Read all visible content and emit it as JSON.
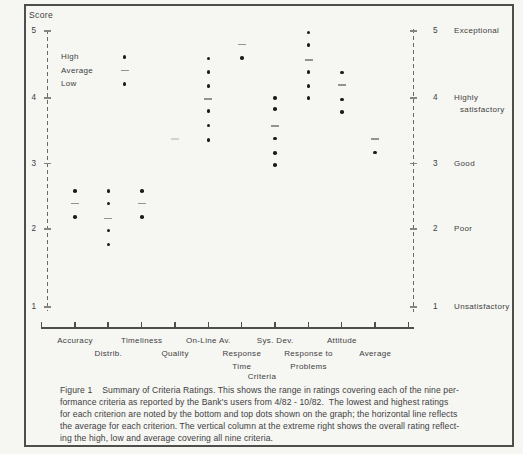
{
  "chart": {
    "score_axis_title": "Score",
    "criteria_axis_title": "Criteria"
  },
  "caption": {
    "lines": [
      "Figure 1    Summary of Criteria Ratings. This shows the range in ratings covering each of the nine per-",
      "formance criteria as reported by the Bank's users from 4/82 - 10/82.  The lowest and highest ratings",
      "for each criterion are noted by the bottom and top dots shown on the graph; the horizontal line reflects",
      "the average for each criterion. The vertical column at the extreme right shows the overall rating reflect-",
      "ing the high, low and average covering all nine criteria."
    ]
  },
  "colors": {
    "paper": "#f6f6f3",
    "ink": "#3e3e3e",
    "dot": "#1c1c1c",
    "dash": "#94948c"
  },
  "chart_data": {
    "type": "scatter",
    "title": "Figure 1  Summary of Criteria Ratings",
    "xlabel": "Criteria",
    "ylabel": "Score",
    "ylim": [
      1,
      5
    ],
    "grid": false,
    "legend": [
      {
        "label": "High",
        "symbol": "dot"
      },
      {
        "label": "Average",
        "symbol": "dash"
      },
      {
        "label": "Low",
        "symbol": "dot"
      }
    ],
    "score_ratings": [
      {
        "score": 5,
        "rating": "Exceptional",
        "rating_lines": [
          "Exceptional"
        ]
      },
      {
        "score": 4,
        "rating": "Highly satisfactory",
        "rating_lines": [
          "Highly",
          "satisfactory"
        ]
      },
      {
        "score": 3,
        "rating": "Good",
        "rating_lines": [
          "Good"
        ]
      },
      {
        "score": 2,
        "rating": "Poor",
        "rating_lines": [
          "Poor"
        ]
      },
      {
        "score": 1,
        "rating": "Unsatisfactory",
        "rating_lines": [
          "Unsatisfactory"
        ]
      }
    ],
    "categories": [
      "Accuracy",
      "Distrib.",
      "Timeliness",
      "Quality",
      "On-Line Av.",
      "Response Time",
      "Sys. Dev.",
      "Response to Problems",
      "Attitude",
      "Average"
    ],
    "columns": [
      {
        "label": "Accuracy",
        "label_lines": [
          "Accuracy"
        ],
        "label_row": 1,
        "dots": [
          2.58,
          2.18
        ],
        "average_dash": 2.39
      },
      {
        "label": "Distrib.",
        "label_lines": [
          "Distrib."
        ],
        "label_row": 2,
        "dots": [
          2.58,
          2.39,
          1.98,
          1.8
        ],
        "average_dash": 2.16
      },
      {
        "label": "Timeliness",
        "label_lines": [
          "Timeliness"
        ],
        "label_row": 1,
        "dots": [
          2.58,
          2.18
        ],
        "average_dash": 2.39
      },
      {
        "label": "Quality",
        "label_lines": [
          "Quality"
        ],
        "label_row": 2,
        "dots": [],
        "average_dash": 3.37,
        "faint": true
      },
      {
        "label": "On-Line Av.",
        "label_lines": [
          "On-Line Av."
        ],
        "label_row": 1,
        "dots": [
          4.59,
          4.39,
          4.18,
          3.8,
          3.58,
          3.36
        ],
        "average_dash": 3.98
      },
      {
        "label": "Response Time",
        "label_lines": [
          "Response",
          "Time"
        ],
        "label_row": 2,
        "dots": [
          4.6
        ],
        "average_dash": 4.8
      },
      {
        "label": "Sys. Dev.",
        "label_lines": [
          "Sys. Dev."
        ],
        "label_row": 1,
        "dots": [
          4.0,
          3.83,
          3.38,
          3.16,
          2.98
        ],
        "average_dash": 3.57
      },
      {
        "label": "Response to Problems",
        "label_lines": [
          "Response to",
          "Problems"
        ],
        "label_row": 2,
        "dots": [
          4.98,
          4.79,
          4.39,
          4.18,
          4.0
        ],
        "average_dash": 4.57
      },
      {
        "label": "Attitude",
        "label_lines": [
          "Attitude"
        ],
        "label_row": 1,
        "dots": [
          4.38,
          3.98,
          3.79
        ],
        "average_dash": 4.19
      },
      {
        "label": "Average",
        "label_lines": [
          "Average"
        ],
        "label_row": 2,
        "dots": [
          3.17
        ],
        "average_dash": 3.37
      }
    ]
  }
}
